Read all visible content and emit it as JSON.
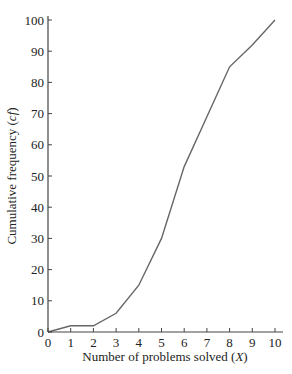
{
  "chart_data": {
    "type": "line",
    "title": "",
    "xlabel": "Number of problems solved (X)",
    "ylabel": "Cumulative frequency (cf)",
    "x": [
      0,
      1,
      2,
      3,
      4,
      5,
      6,
      7,
      8,
      9,
      10
    ],
    "series": [
      {
        "name": "cf",
        "values": [
          0,
          2,
          2,
          6,
          15,
          30,
          53,
          69,
          85,
          92,
          100
        ]
      }
    ],
    "xlim": [
      0,
      10
    ],
    "ylim": [
      0,
      100
    ],
    "xticks": [
      0,
      1,
      2,
      3,
      4,
      5,
      6,
      7,
      8,
      9,
      10
    ],
    "yticks": [
      0,
      10,
      20,
      30,
      40,
      50,
      60,
      70,
      80,
      90,
      100
    ],
    "grid": false,
    "legend": null,
    "line_color": "#666666"
  },
  "labels": {
    "xlabel_main": "Number of problems solved (",
    "xlabel_var": "X",
    "xlabel_close": ")",
    "ylabel_main": "Cumulative frequency (",
    "ylabel_var": "cf",
    "ylabel_close": ")"
  }
}
